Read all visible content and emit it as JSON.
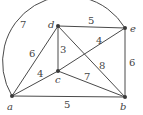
{
  "diagram": {
    "type": "weighted-graph",
    "vertices": [
      {
        "id": "a",
        "label": "a",
        "x": 12,
        "y": 96
      },
      {
        "id": "b",
        "label": "b",
        "x": 125,
        "y": 97
      },
      {
        "id": "c",
        "label": "c",
        "x": 58,
        "y": 71
      },
      {
        "id": "d",
        "label": "d",
        "x": 58,
        "y": 26
      },
      {
        "id": "e",
        "label": "e",
        "x": 125,
        "y": 28
      }
    ],
    "edges": [
      {
        "from": "a",
        "to": "e",
        "weight": "7",
        "shape": "arc"
      },
      {
        "from": "a",
        "to": "d",
        "weight": "6"
      },
      {
        "from": "a",
        "to": "c",
        "weight": "4"
      },
      {
        "from": "a",
        "to": "b",
        "weight": "5"
      },
      {
        "from": "d",
        "to": "e",
        "weight": "5"
      },
      {
        "from": "d",
        "to": "c",
        "weight": "3"
      },
      {
        "from": "d",
        "to": "b",
        "weight": "8"
      },
      {
        "from": "c",
        "to": "e",
        "weight": "4"
      },
      {
        "from": "c",
        "to": "b",
        "weight": "7"
      },
      {
        "from": "e",
        "to": "b",
        "weight": "6"
      }
    ]
  }
}
